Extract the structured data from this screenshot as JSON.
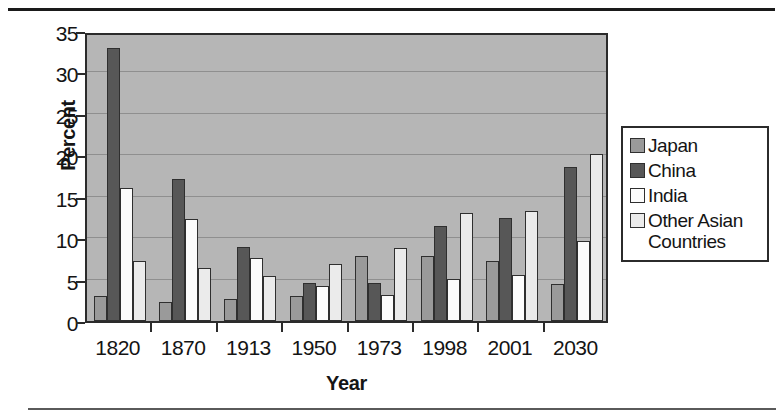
{
  "chart_data": {
    "type": "bar",
    "title": "",
    "xlabel": "Year",
    "ylabel": "Percent",
    "categories": [
      "1820",
      "1870",
      "1913",
      "1950",
      "1973",
      "1998",
      "2001",
      "2030"
    ],
    "series": [
      {
        "name": "Japan",
        "color": "#9a9a9a",
        "values": [
          3.0,
          2.3,
          2.7,
          3.0,
          7.8,
          7.8,
          7.2,
          4.5
        ]
      },
      {
        "name": "China",
        "color": "#575757",
        "values": [
          33.0,
          17.2,
          8.9,
          4.6,
          4.6,
          11.5,
          12.4,
          18.6
        ]
      },
      {
        "name": "India",
        "color": "#fcfcfc",
        "values": [
          16.0,
          12.3,
          7.6,
          4.2,
          3.1,
          5.1,
          5.5,
          9.7
        ]
      },
      {
        "name": "Other Asian Countries",
        "color": "#ebebeb",
        "values": [
          7.2,
          6.4,
          5.4,
          6.9,
          8.8,
          13.0,
          13.3,
          20.1
        ]
      }
    ],
    "ylim": [
      0,
      35
    ],
    "yticks": [
      0,
      5,
      10,
      15,
      20,
      25,
      30,
      35
    ],
    "ytick_labels": [
      "0",
      "5",
      "10",
      "15",
      "20",
      "25",
      "30",
      "35"
    ],
    "grid": true,
    "legend_position": "right",
    "plot_background": "#b6b6b6"
  },
  "legend": {
    "items": [
      {
        "label": "Japan"
      },
      {
        "label": "China"
      },
      {
        "label": "India"
      },
      {
        "label": "Other Asian Countries"
      }
    ]
  }
}
